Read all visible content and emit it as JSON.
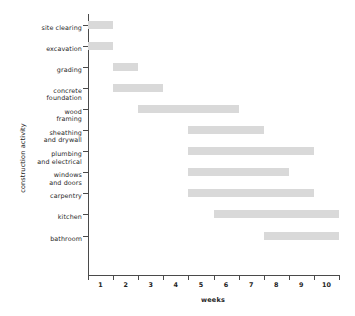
{
  "chart_data": {
    "type": "bar",
    "subtype": "gantt",
    "title": "",
    "xlabel": "weeks",
    "ylabel": "construction activity",
    "xlim": [
      0.5,
      10.5
    ],
    "grid": false,
    "legend": null,
    "xticks": [
      "1",
      "2",
      "3",
      "4",
      "5",
      "6",
      "7",
      "8",
      "9",
      "10"
    ],
    "xtick_values": [
      1,
      2,
      3,
      4,
      5,
      6,
      7,
      8,
      9,
      10
    ],
    "bar_color": "#d9d9d9",
    "axis_color": "#4a4a4a",
    "categories": [
      "site clearing",
      "excavation",
      "grading",
      "concrete\nfoundation",
      "wood\nframing",
      "sheathing\nand drywall",
      "plumbing\nand electrical",
      "windows\nand doors",
      "carpentry",
      "kitchen",
      "bathroom"
    ],
    "tasks": [
      {
        "name": "site clearing",
        "start": 0.5,
        "end": 1.5
      },
      {
        "name": "excavation",
        "start": 0.5,
        "end": 1.5
      },
      {
        "name": "grading",
        "start": 1.5,
        "end": 2.5
      },
      {
        "name": "concrete foundation",
        "start": 1.5,
        "end": 3.5
      },
      {
        "name": "wood framing",
        "start": 2.5,
        "end": 6.5
      },
      {
        "name": "sheathing and drywall",
        "start": 4.5,
        "end": 7.5
      },
      {
        "name": "plumbing and electrical",
        "start": 4.5,
        "end": 9.5
      },
      {
        "name": "windows and doors",
        "start": 4.5,
        "end": 8.5
      },
      {
        "name": "carpentry",
        "start": 4.5,
        "end": 9.5
      },
      {
        "name": "kitchen",
        "start": 5.5,
        "end": 10.5
      },
      {
        "name": "bathroom",
        "start": 7.5,
        "end": 10.5
      }
    ],
    "durations_weeks": [
      1,
      1,
      1,
      2,
      4,
      3,
      5,
      4,
      5,
      5,
      3
    ]
  }
}
